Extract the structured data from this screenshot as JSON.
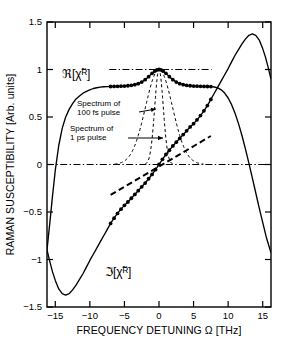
{
  "chart_data": {
    "type": "line",
    "title": "",
    "xlabel": "FREQUENCY DETUNING Ω [THz]",
    "ylabel": "RAMAN SUSCEPTIBILITY [Arb. units]",
    "xlim": [
      -16.2,
      16.2
    ],
    "ylim": [
      -1.5,
      1.5
    ],
    "xticks": [
      -15,
      -10,
      -5,
      0,
      5,
      10,
      15
    ],
    "xticklabels": [
      "−15",
      "−10",
      "−5",
      "0",
      "5",
      "10",
      "15"
    ],
    "yticks": [
      1.5,
      1,
      0.5,
      0,
      -0.5,
      -1,
      -1.5
    ],
    "yticklabels": [
      "1.5",
      "1",
      "0.5",
      "0",
      "−0.5",
      "−1",
      "−1.5"
    ],
    "grid": false,
    "legend": "none",
    "series": [
      {
        "name": "Re[chi_R] solid",
        "label": "ℜ[χ̃ₚ]",
        "style": "solid-with-dots",
        "points": [
          [
            -16.2,
            -0.9
          ],
          [
            -15.8,
            -0.62
          ],
          [
            -15.4,
            -0.33
          ],
          [
            -15.0,
            -0.06
          ],
          [
            -14.5,
            0.2
          ],
          [
            -14.0,
            0.38
          ],
          [
            -13.5,
            0.5
          ],
          [
            -13.0,
            0.58
          ],
          [
            -12.5,
            0.64
          ],
          [
            -12.0,
            0.69
          ],
          [
            -11.5,
            0.72
          ],
          [
            -11.0,
            0.75
          ],
          [
            -10.5,
            0.77
          ],
          [
            -10.0,
            0.785
          ],
          [
            -9.5,
            0.8
          ],
          [
            -9.0,
            0.808
          ],
          [
            -8.5,
            0.814
          ],
          [
            -8.0,
            0.818
          ],
          [
            -7.5,
            0.82
          ],
          [
            -7.0,
            0.821
          ],
          [
            -6.5,
            0.822
          ],
          [
            -6.0,
            0.823
          ],
          [
            -5.5,
            0.824
          ],
          [
            -5.0,
            0.826
          ],
          [
            -4.5,
            0.829
          ],
          [
            -4.0,
            0.833
          ],
          [
            -3.5,
            0.84
          ],
          [
            -3.0,
            0.851
          ],
          [
            -2.5,
            0.868
          ],
          [
            -2.0,
            0.893
          ],
          [
            -1.5,
            0.925
          ],
          [
            -1.0,
            0.96
          ],
          [
            -0.6,
            0.983
          ],
          [
            -0.3,
            0.995
          ],
          [
            0.0,
            1.0
          ],
          [
            0.3,
            0.995
          ],
          [
            0.6,
            0.983
          ],
          [
            1.0,
            0.96
          ],
          [
            1.5,
            0.925
          ],
          [
            2.0,
            0.893
          ],
          [
            2.5,
            0.868
          ],
          [
            3.0,
            0.851
          ],
          [
            3.5,
            0.84
          ],
          [
            4.0,
            0.833
          ],
          [
            4.5,
            0.829
          ],
          [
            5.0,
            0.826
          ],
          [
            5.5,
            0.824
          ],
          [
            6.0,
            0.823
          ],
          [
            6.5,
            0.822
          ],
          [
            7.0,
            0.821
          ],
          [
            7.5,
            0.82
          ],
          [
            8.0,
            0.816
          ],
          [
            8.5,
            0.806
          ],
          [
            9.0,
            0.786
          ],
          [
            9.5,
            0.752
          ],
          [
            10.0,
            0.7
          ],
          [
            10.5,
            0.63
          ],
          [
            11.0,
            0.54
          ],
          [
            11.5,
            0.43
          ],
          [
            12.0,
            0.305
          ],
          [
            12.5,
            0.165
          ],
          [
            13.0,
            0.015
          ],
          [
            13.5,
            -0.14
          ],
          [
            14.0,
            -0.3
          ],
          [
            14.5,
            -0.46
          ],
          [
            15.0,
            -0.61
          ],
          [
            15.5,
            -0.76
          ],
          [
            16.2,
            -0.93
          ]
        ],
        "dot_range": [
          -7.2,
          7.6
        ]
      },
      {
        "name": "Im[chi_R] solid",
        "label": "ℑ[χ̃ₚ]",
        "style": "solid-with-dots",
        "points": [
          [
            -16.2,
            -0.9
          ],
          [
            -15.8,
            -1.02
          ],
          [
            -15.4,
            -1.13
          ],
          [
            -15.0,
            -1.22
          ],
          [
            -14.5,
            -1.31
          ],
          [
            -14.0,
            -1.36
          ],
          [
            -13.5,
            -1.375
          ],
          [
            -13.0,
            -1.36
          ],
          [
            -12.5,
            -1.32
          ],
          [
            -12.0,
            -1.27
          ],
          [
            -11.5,
            -1.21
          ],
          [
            -11.0,
            -1.15
          ],
          [
            -10.5,
            -1.08
          ],
          [
            -10.0,
            -1.01
          ],
          [
            -9.5,
            -0.945
          ],
          [
            -9.0,
            -0.88
          ],
          [
            -8.5,
            -0.815
          ],
          [
            -8.0,
            -0.75
          ],
          [
            -7.5,
            -0.685
          ],
          [
            -7.0,
            -0.62
          ],
          [
            -6.5,
            -0.565
          ],
          [
            -6.0,
            -0.515
          ],
          [
            -5.5,
            -0.47
          ],
          [
            -5.0,
            -0.43
          ],
          [
            -4.5,
            -0.395
          ],
          [
            -4.0,
            -0.355
          ],
          [
            -3.5,
            -0.315
          ],
          [
            -3.0,
            -0.275
          ],
          [
            -2.5,
            -0.235
          ],
          [
            -2.0,
            -0.195
          ],
          [
            -1.5,
            -0.15
          ],
          [
            -1.0,
            -0.105
          ],
          [
            -0.5,
            -0.055
          ],
          [
            0.0,
            0.0
          ],
          [
            0.5,
            0.055
          ],
          [
            1.0,
            0.105
          ],
          [
            1.5,
            0.15
          ],
          [
            2.0,
            0.195
          ],
          [
            2.5,
            0.235
          ],
          [
            3.0,
            0.275
          ],
          [
            3.5,
            0.315
          ],
          [
            4.0,
            0.355
          ],
          [
            4.5,
            0.395
          ],
          [
            5.0,
            0.43
          ],
          [
            5.5,
            0.47
          ],
          [
            6.0,
            0.515
          ],
          [
            6.5,
            0.565
          ],
          [
            7.0,
            0.62
          ],
          [
            7.5,
            0.685
          ],
          [
            8.0,
            0.75
          ],
          [
            8.5,
            0.815
          ],
          [
            9.0,
            0.88
          ],
          [
            9.5,
            0.945
          ],
          [
            10.0,
            1.01
          ],
          [
            10.5,
            1.08
          ],
          [
            11.0,
            1.15
          ],
          [
            11.5,
            1.21
          ],
          [
            12.0,
            1.27
          ],
          [
            12.5,
            1.32
          ],
          [
            13.0,
            1.36
          ],
          [
            13.5,
            1.375
          ],
          [
            14.0,
            1.36
          ],
          [
            14.5,
            1.31
          ],
          [
            15.0,
            1.22
          ],
          [
            15.4,
            1.13
          ],
          [
            15.8,
            1.02
          ],
          [
            16.2,
            0.9
          ]
        ],
        "dot_range": [
          -7.2,
          7.6
        ]
      },
      {
        "name": "unity-reference-line",
        "style": "dash-dot",
        "points": [
          [
            -7.2,
            1.0
          ],
          [
            7.6,
            1.0
          ]
        ]
      },
      {
        "name": "zero-reference-line",
        "style": "dash-dot",
        "points": [
          [
            -16.2,
            0.0
          ],
          [
            16.2,
            0.0
          ]
        ]
      },
      {
        "name": "linear-slope-guide",
        "style": "dashed-thick",
        "points": [
          [
            -7.0,
            -0.32
          ],
          [
            7.5,
            0.3
          ]
        ]
      }
    ],
    "gaussians": [
      {
        "name": "Spectrum of 100 fs pulse",
        "style": "dashed",
        "center": 0.0,
        "sigma": 1.95,
        "amplitude": 1.0
      },
      {
        "name": "Spectrum of 1 ps pulse",
        "style": "dashed",
        "center": 0.0,
        "sigma": 0.62,
        "amplitude": 1.0
      }
    ],
    "annotations": [
      {
        "name": "annotation-100fs",
        "line1": "Spectrum of",
        "line2": "100 fs pulse",
        "text_x": 77,
        "text_y": 106,
        "arrow_from": [
          139,
          112
        ],
        "arrow_to": [
          156,
          109
        ]
      },
      {
        "name": "annotation-1ps",
        "line1": "Spectrum of",
        "line2": "1 ps pulse",
        "text_x": 70,
        "text_y": 131,
        "arrow_from": [
          128,
          138
        ],
        "arrow_to": [
          163,
          138
        ]
      }
    ],
    "curve_labels": [
      {
        "name": "real-part-label",
        "text": "ℜ[χ̃ᴿ]",
        "x": 62,
        "y": 78
      },
      {
        "name": "imag-part-label",
        "text": "ℑ[χ̃ᴿ]",
        "x": 105,
        "y": 276
      }
    ]
  }
}
